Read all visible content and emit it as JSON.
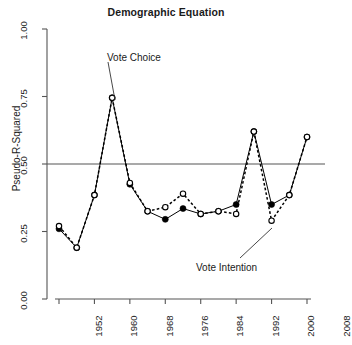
{
  "chart_data": {
    "type": "line",
    "title": "Demographic Equation",
    "xlabel": "",
    "ylabel": "Pseudo-R-Squared",
    "x": [
      1952,
      1956,
      1960,
      1964,
      1968,
      1972,
      1976,
      1980,
      1984,
      1988,
      1992,
      1996,
      2000,
      2004,
      2008
    ],
    "xlim": [
      1950,
      2010
    ],
    "ylim": [
      0.0,
      1.0
    ],
    "xticks": [
      1952,
      1960,
      1968,
      1976,
      1984,
      1992,
      2000,
      2008
    ],
    "xtick_labels": [
      "1952",
      "1960",
      "1968",
      "1976",
      "1984",
      "1992",
      "2000",
      "2008"
    ],
    "yticks": [
      0.0,
      0.25,
      0.5,
      0.75,
      1.0
    ],
    "ytick_labels": [
      "0.00",
      "0.25",
      "0.50",
      "0.75",
      "1.00"
    ],
    "grid": false,
    "legend_position": "inline-annotations",
    "reference_line": {
      "y": 0.5,
      "orientation": "horizontal"
    },
    "series": [
      {
        "name": "Vote Choice",
        "marker": "filled-circle",
        "line_style": "solid",
        "values": [
          0.26,
          0.19,
          0.385,
          0.745,
          0.425,
          0.325,
          0.295,
          0.335,
          0.315,
          0.325,
          0.35,
          0.62,
          0.35,
          0.385,
          0.6
        ]
      },
      {
        "name": "Vote Intention",
        "marker": "open-circle",
        "line_style": "dashed",
        "values": [
          0.27,
          0.19,
          0.385,
          0.745,
          0.43,
          0.325,
          0.34,
          0.39,
          0.315,
          0.325,
          0.315,
          0.62,
          0.29,
          0.385,
          0.6
        ]
      }
    ],
    "annotations": [
      {
        "text": "Vote Choice",
        "points_to_year": 1964,
        "points_to_value": 0.745
      },
      {
        "text": "Vote Intention",
        "points_to_year": 2000,
        "points_to_value": 0.29
      }
    ],
    "colors": {
      "line": "#000000",
      "axis": "#555555",
      "reference_line": "#555555",
      "background": "#ffffff"
    }
  }
}
